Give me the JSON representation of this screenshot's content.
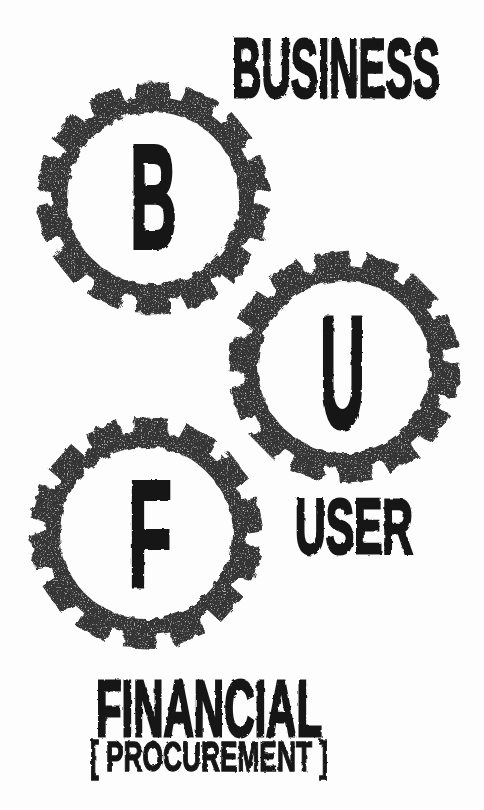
{
  "page": {
    "background": "#fdfdfd"
  },
  "colors": {
    "gear_ink": "#363636",
    "text_ink": "#151515"
  },
  "diagram": {
    "type": "gears",
    "gears": [
      {
        "id": "business",
        "letter": "B",
        "label": "BUSINESS"
      },
      {
        "id": "user",
        "letter": "U",
        "label": "USER"
      },
      {
        "id": "financial",
        "letter": "F",
        "label": "FINANCIAL",
        "sublabel": "[ PROCUREMENT ]"
      }
    ]
  }
}
